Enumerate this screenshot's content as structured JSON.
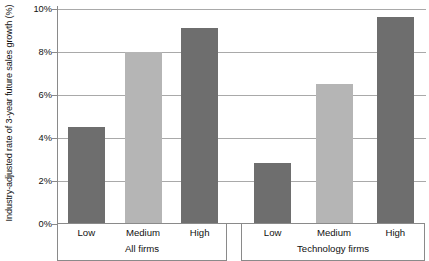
{
  "chart_data": {
    "type": "bar",
    "title": "",
    "xlabel": "",
    "ylabel": "Industry-adjusted rate of 3-year future sales growth (%)",
    "ylim": [
      0,
      10
    ],
    "ytick_labels": [
      "10%",
      "8%",
      "6%",
      "4%",
      "2%",
      "0%"
    ],
    "ytick_values": [
      10,
      8,
      6,
      4,
      2,
      0
    ],
    "grid": true,
    "legend": "none",
    "categories": [
      "Low",
      "Medium",
      "High"
    ],
    "groups": [
      {
        "name": "All firms",
        "bars": [
          {
            "category": "Low",
            "value": 4.5,
            "color": "#6e6e6e"
          },
          {
            "category": "Medium",
            "value": 8.0,
            "color": "#b5b5b5"
          },
          {
            "category": "High",
            "value": 9.1,
            "color": "#6e6e6e"
          }
        ]
      },
      {
        "name": "Technology firms",
        "bars": [
          {
            "category": "Low",
            "value": 2.8,
            "color": "#6e6e6e"
          },
          {
            "category": "Medium",
            "value": 6.5,
            "color": "#b5b5b5"
          },
          {
            "category": "High",
            "value": 9.6,
            "color": "#6e6e6e"
          }
        ]
      }
    ],
    "colors": {
      "bar_dark": "#6e6e6e",
      "bar_light": "#b5b5b5",
      "gridline": "#a9a9a9",
      "axis": "#8a8a8a",
      "background": "#ffffff",
      "text": "#111111"
    }
  }
}
